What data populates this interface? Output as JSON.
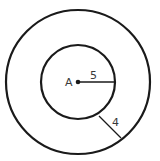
{
  "diagram": {
    "type": "concentric-circles",
    "center_label": "A",
    "inner_radius_label": "5",
    "ring_width_label": "4",
    "stroke_color": "#1a1a1a",
    "background": "#ffffff"
  }
}
